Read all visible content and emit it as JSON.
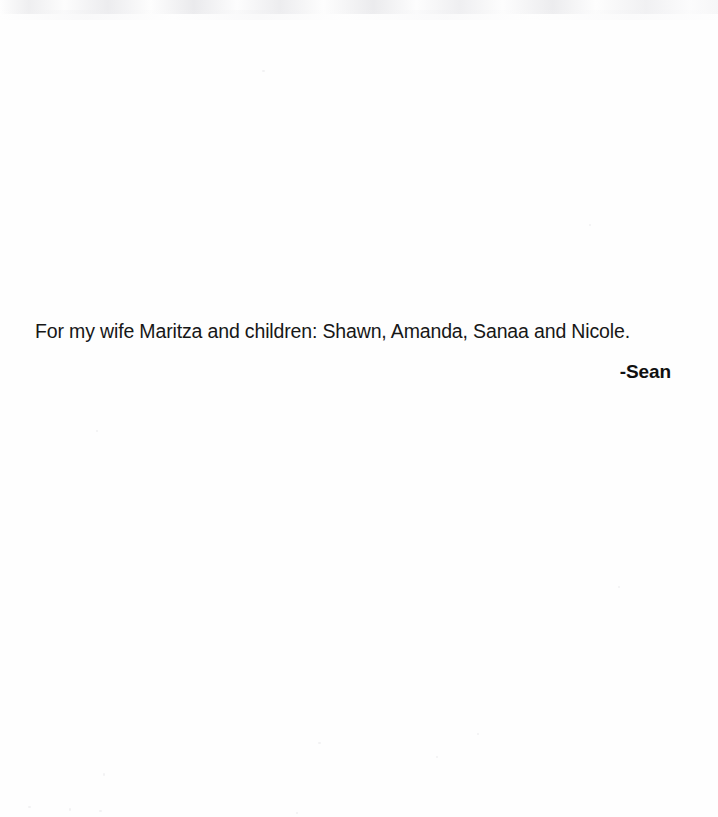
{
  "document": {
    "type": "scanned-book-dedication-page",
    "page_background": "#fefefe",
    "text_color": "#171717",
    "dedication": {
      "body_text": "For my wife Maritza and children: Shawn, Amanda, Sanaa and Nicole.",
      "signature": "-Sean"
    }
  },
  "artifacts": {
    "top_noise_band_label": "scanner-edge-noise",
    "speckles": [
      {
        "x": 262,
        "y": 70,
        "w": 3,
        "h": 2
      },
      {
        "x": 96,
        "y": 430,
        "w": 2,
        "h": 2
      },
      {
        "x": 318,
        "y": 742,
        "w": 3,
        "h": 2
      },
      {
        "x": 436,
        "y": 756,
        "w": 2,
        "h": 2
      },
      {
        "x": 103,
        "y": 773,
        "w": 2,
        "h": 3
      },
      {
        "x": 28,
        "y": 806,
        "w": 3,
        "h": 2
      },
      {
        "x": 69,
        "y": 808,
        "w": 2,
        "h": 3
      },
      {
        "x": 99,
        "y": 810,
        "w": 3,
        "h": 2
      },
      {
        "x": 296,
        "y": 812,
        "w": 2,
        "h": 2
      },
      {
        "x": 477,
        "y": 733,
        "w": 2,
        "h": 2
      },
      {
        "x": 589,
        "y": 224,
        "w": 2,
        "h": 2
      },
      {
        "x": 618,
        "y": 586,
        "w": 2,
        "h": 2
      }
    ]
  }
}
